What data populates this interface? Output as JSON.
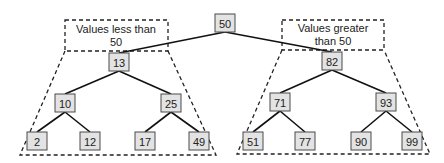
{
  "diagram": {
    "type": "binary-search-tree",
    "root": "50",
    "labels": {
      "left_line1": "Values less than",
      "left_line2": "50",
      "right_line1": "Values greater",
      "right_line2": "than 50"
    },
    "nodes": [
      {
        "id": "n50",
        "value": "50",
        "x": 225,
        "y": 23
      },
      {
        "id": "n13",
        "value": "13",
        "x": 119,
        "y": 62
      },
      {
        "id": "n82",
        "value": "82",
        "x": 332,
        "y": 61
      },
      {
        "id": "n10",
        "value": "10",
        "x": 65,
        "y": 103
      },
      {
        "id": "n25",
        "value": "25",
        "x": 171,
        "y": 103
      },
      {
        "id": "n71",
        "value": "71",
        "x": 280,
        "y": 102
      },
      {
        "id": "n93",
        "value": "93",
        "x": 386,
        "y": 102
      },
      {
        "id": "n2",
        "value": "2",
        "x": 37,
        "y": 141
      },
      {
        "id": "n12",
        "value": "12",
        "x": 90,
        "y": 141
      },
      {
        "id": "n17",
        "value": "17",
        "x": 145,
        "y": 141
      },
      {
        "id": "n49",
        "value": "49",
        "x": 199,
        "y": 141
      },
      {
        "id": "n51",
        "value": "51",
        "x": 253,
        "y": 141
      },
      {
        "id": "n77",
        "value": "77",
        "x": 305,
        "y": 141
      },
      {
        "id": "n90",
        "value": "90",
        "x": 361,
        "y": 141
      },
      {
        "id": "n99",
        "value": "99",
        "x": 412,
        "y": 141
      }
    ],
    "edges": [
      [
        "n50",
        "n13"
      ],
      [
        "n50",
        "n82"
      ],
      [
        "n13",
        "n10"
      ],
      [
        "n13",
        "n25"
      ],
      [
        "n82",
        "n71"
      ],
      [
        "n82",
        "n93"
      ],
      [
        "n10",
        "n2"
      ],
      [
        "n10",
        "n12"
      ],
      [
        "n25",
        "n17"
      ],
      [
        "n25",
        "n49"
      ],
      [
        "n71",
        "n51"
      ],
      [
        "n71",
        "n77"
      ],
      [
        "n93",
        "n90"
      ],
      [
        "n93",
        "n99"
      ]
    ],
    "colors": {
      "node_fill": "#e3e3e3",
      "node_stroke": "#4a4a4a",
      "edge": "#111111",
      "dashed": "#222222"
    }
  }
}
